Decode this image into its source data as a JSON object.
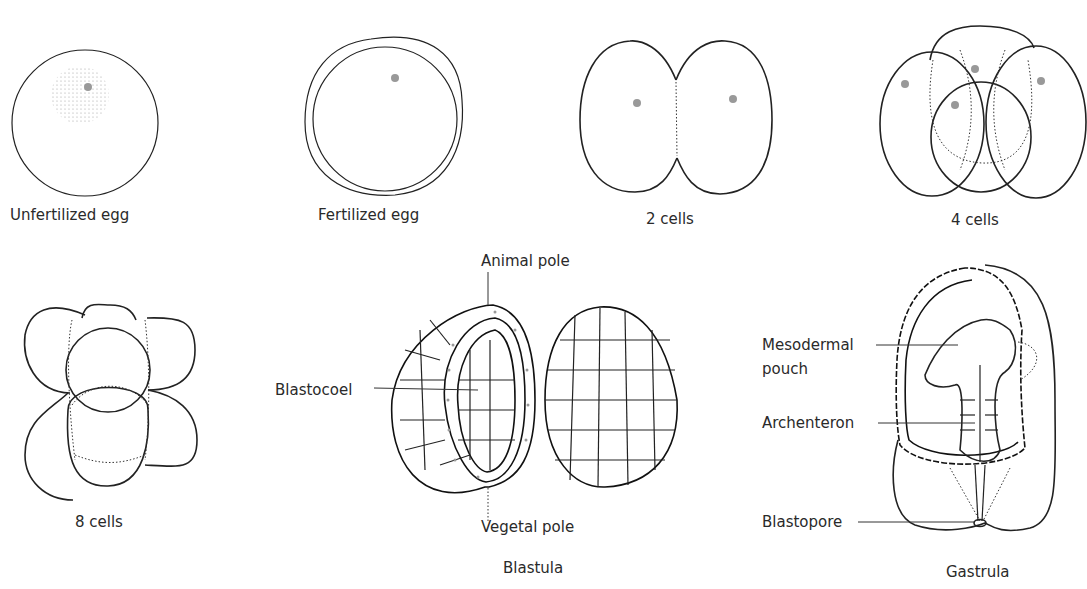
{
  "figure": {
    "stages": [
      {
        "id": "unfertilized",
        "label": "Unfertilized egg"
      },
      {
        "id": "fertilized",
        "label": "Fertilized egg"
      },
      {
        "id": "two-cells",
        "label": "2 cells"
      },
      {
        "id": "four-cells",
        "label": "4 cells"
      },
      {
        "id": "eight-cells",
        "label": "8 cells"
      },
      {
        "id": "blastula",
        "label": "Blastula"
      },
      {
        "id": "gastrula",
        "label": "Gastrula"
      }
    ],
    "blastula_annotations": {
      "animal_pole": "Animal pole",
      "vegetal_pole": "Vegetal pole",
      "blastocoel": "Blastocoel"
    },
    "gastrula_annotations": {
      "mesodermal_pouch_line1": "Mesodermal",
      "mesodermal_pouch_line2": "pouch",
      "archenteron": "Archenteron",
      "blastopore": "Blastopore"
    },
    "colors": {
      "ink": "#222222",
      "nucleus": "#999999",
      "background": "#ffffff"
    }
  }
}
